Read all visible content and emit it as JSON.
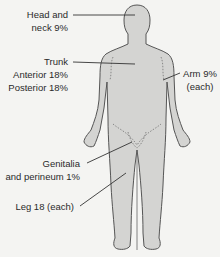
{
  "diagram": {
    "type": "rule-of-nines body surface area",
    "colors": {
      "background": "#f4f4f2",
      "body_fill": "#d4d4d2",
      "outline": "#555555",
      "text": "#2a2a2a"
    },
    "labels": {
      "head": {
        "line1": "Head and",
        "line2": "neck 9%"
      },
      "trunk": {
        "line1": "Trunk",
        "line2": "Anterior 18%",
        "line3": "Posterior 18%"
      },
      "arm": {
        "line1": "Arm 9%",
        "line2": "(each)"
      },
      "genitalia": {
        "line1": "Genitalia",
        "line2": "and perineum 1%"
      },
      "leg": {
        "line1": "Leg 18 (each)"
      }
    }
  }
}
